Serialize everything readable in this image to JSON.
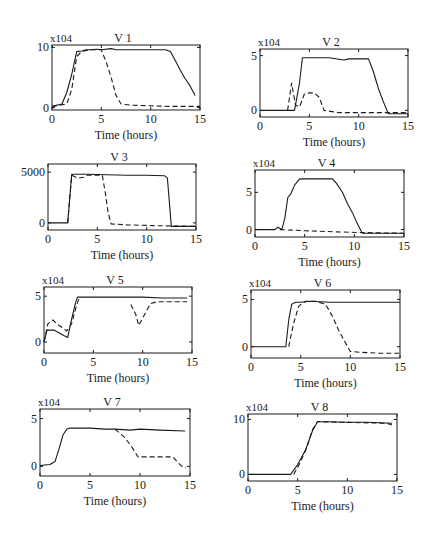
{
  "figure": {
    "xlabel": "Time (hours)",
    "x_ticks": [
      0,
      5,
      10,
      15
    ],
    "x_range": [
      0,
      15
    ],
    "line_color": "#1a1a1a",
    "series_styles": [
      "solid",
      "dashed"
    ]
  },
  "chart_data": [
    {
      "type": "line",
      "title": "V 1",
      "multiplier": "x104",
      "xlabel": "Time (hours)",
      "ylabel": "",
      "box": {
        "left": 52,
        "top": 45,
        "right": 200,
        "bottom": 110
      },
      "xlim": [
        0,
        15
      ],
      "ylim": [
        -0.4,
        10.4
      ],
      "y_ticks": [
        {
          "value": 0,
          "label": "0"
        },
        {
          "value": 10,
          "label": "10"
        }
      ],
      "series": [
        {
          "name": "solid",
          "style": "solid",
          "x": [
            0,
            1,
            1.5,
            2,
            2.5,
            3,
            3.5,
            4,
            4.5,
            5,
            6,
            6.5,
            7,
            8,
            9,
            10,
            11,
            11.5,
            12,
            12.5,
            13,
            13.5,
            14,
            14.5
          ],
          "y": [
            0.2,
            0.6,
            2.5,
            5.5,
            9.3,
            9.4,
            9.6,
            9.6,
            9.7,
            9.6,
            9.8,
            9.6,
            9.6,
            9.6,
            9.6,
            9.6,
            9.6,
            9.6,
            9.3,
            7.8,
            6.2,
            4.8,
            3.6,
            2.0
          ]
        },
        {
          "name": "dashed",
          "style": "dashed",
          "x": [
            0,
            1.5,
            2,
            2.5,
            3,
            3.5,
            4,
            4.5,
            5,
            5.5,
            6,
            6.5,
            7,
            8,
            10,
            12,
            14,
            15
          ],
          "y": [
            0.2,
            0.6,
            3.0,
            8.5,
            9.3,
            9.5,
            9.6,
            9.6,
            9.6,
            7.5,
            5.0,
            2.0,
            0.6,
            0.4,
            0.3,
            0.2,
            0.2,
            0.2
          ]
        }
      ]
    },
    {
      "type": "line",
      "title": "V 2",
      "multiplier": "x104",
      "xlabel": "Time (hours)",
      "ylabel": "",
      "box": {
        "left": 260,
        "top": 49,
        "right": 408,
        "bottom": 117
      },
      "xlim": [
        0,
        15
      ],
      "ylim": [
        -0.6,
        5.6
      ],
      "y_ticks": [
        {
          "value": 0,
          "label": "0"
        },
        {
          "value": 5,
          "label": "5"
        }
      ],
      "series": [
        {
          "name": "solid",
          "style": "solid",
          "x": [
            0,
            3.5,
            4,
            4.3,
            5,
            7,
            8.5,
            9,
            10,
            11,
            11.5,
            12,
            12.5,
            13,
            15
          ],
          "y": [
            0,
            0,
            2.5,
            4.8,
            4.8,
            4.8,
            4.6,
            4.7,
            4.7,
            4.7,
            3.5,
            2.0,
            0.8,
            -0.3,
            -0.3
          ]
        },
        {
          "name": "dashed",
          "style": "dashed",
          "x": [
            2.8,
            3.2,
            3.6,
            4.0,
            4.5,
            5.0,
            5.5,
            6.0,
            6.5,
            8,
            10,
            12,
            15
          ],
          "y": [
            0,
            2.5,
            0.5,
            0.3,
            1.5,
            1.6,
            1.6,
            1.2,
            0.0,
            -0.2,
            -0.2,
            -0.2,
            -0.2
          ]
        }
      ]
    },
    {
      "type": "line",
      "title": "V 3",
      "multiplier": "",
      "xlabel": "Time (hours)",
      "ylabel": "",
      "box": {
        "left": 48,
        "top": 164,
        "right": 196,
        "bottom": 230
      },
      "xlim": [
        0,
        15
      ],
      "ylim": [
        -700,
        5800
      ],
      "y_ticks": [
        {
          "value": 0,
          "label": "0"
        },
        {
          "value": 5000,
          "label": "5000"
        }
      ],
      "series": [
        {
          "name": "solid",
          "style": "solid",
          "x": [
            0,
            2.0,
            2.4,
            4,
            6,
            8,
            10,
            11.8,
            12.1,
            12.3,
            12.5,
            15
          ],
          "y": [
            0,
            0,
            4800,
            4800,
            4750,
            4700,
            4700,
            4650,
            4400,
            2000,
            -350,
            -350
          ]
        },
        {
          "name": "dashed",
          "style": "dashed",
          "x": [
            2.0,
            2.4,
            3.0,
            3.6,
            4.0,
            5.5,
            5.8,
            6.1,
            6.4,
            8,
            10,
            12,
            15
          ],
          "y": [
            0,
            4700,
            4400,
            4500,
            4700,
            4700,
            3000,
            1000,
            -100,
            -200,
            -250,
            -300,
            -350
          ]
        }
      ]
    },
    {
      "type": "line",
      "title": "V 4",
      "multiplier": "x104",
      "xlabel": "Time (hours)",
      "ylabel": "",
      "box": {
        "left": 255,
        "top": 170,
        "right": 404,
        "bottom": 237
      },
      "xlim": [
        0,
        15
      ],
      "ylim": [
        -1.0,
        8.0
      ],
      "y_ticks": [
        {
          "value": 0,
          "label": "0"
        },
        {
          "value": 5,
          "label": "5"
        }
      ],
      "series": [
        {
          "name": "solid",
          "style": "solid",
          "x": [
            0,
            2,
            2.3,
            2.7,
            3.0,
            3.3,
            3.6,
            4.0,
            4.5,
            5,
            6,
            7,
            7.8,
            8.2,
            8.8,
            9.3,
            9.8,
            10.3,
            10.8,
            12,
            15
          ],
          "y": [
            0,
            0,
            0.3,
            0.0,
            1.5,
            4.3,
            4.8,
            6.0,
            6.8,
            6.8,
            6.8,
            6.8,
            6.8,
            6.2,
            5.0,
            3.5,
            2.3,
            0.8,
            -0.5,
            -0.5,
            -0.5
          ]
        },
        {
          "name": "dashed",
          "style": "dashed",
          "x": [
            2.5,
            5,
            8,
            10.5,
            15
          ],
          "y": [
            0.0,
            -0.15,
            -0.3,
            -0.4,
            -0.5
          ]
        }
      ]
    },
    {
      "type": "line",
      "title": "V 5",
      "multiplier": "x104",
      "xlabel": "Time (hours)",
      "ylabel": "",
      "box": {
        "left": 44,
        "top": 287,
        "right": 192,
        "bottom": 353
      },
      "xlim": [
        0,
        15
      ],
      "ylim": [
        -1.2,
        6.0
      ],
      "y_ticks": [
        {
          "value": 0,
          "label": "0"
        },
        {
          "value": 5,
          "label": "5"
        }
      ],
      "series": [
        {
          "name": "solid",
          "style": "solid",
          "x": [
            0,
            0.3,
            0.6,
            1.0,
            1.5,
            2.0,
            2.4,
            2.8,
            3.2,
            3.4,
            5,
            8,
            10,
            12,
            14.5
          ],
          "y": [
            0,
            1.3,
            1.3,
            1.3,
            1.0,
            0.7,
            0.5,
            2.5,
            4.3,
            4.9,
            4.9,
            4.9,
            4.9,
            4.8,
            4.8
          ]
        },
        {
          "name": "dashed",
          "style": "dashed",
          "x": [
            0,
            0.4,
            0.9,
            1.3,
            1.8,
            2.3,
            2.8,
            3.3,
            3.6
          ],
          "y": [
            0,
            2.0,
            2.4,
            2.0,
            1.6,
            1.2,
            2.0,
            4.0,
            4.9
          ]
        },
        {
          "name": "dashed-late",
          "style": "dashed",
          "x": [
            8.8,
            9.3,
            9.6,
            10.2,
            10.8,
            11.5,
            13,
            14.5
          ],
          "y": [
            4.1,
            3.0,
            1.8,
            3.0,
            4.2,
            4.4,
            4.4,
            4.4
          ]
        }
      ]
    },
    {
      "type": "line",
      "title": "V 6",
      "multiplier": "x104",
      "xlabel": "Time (hours)",
      "ylabel": "",
      "box": {
        "left": 251,
        "top": 290,
        "right": 400,
        "bottom": 358
      },
      "xlim": [
        0,
        15
      ],
      "ylim": [
        -1.2,
        6.0
      ],
      "y_ticks": [
        {
          "value": 0,
          "label": "0"
        },
        {
          "value": 5,
          "label": "5"
        }
      ],
      "series": [
        {
          "name": "solid",
          "style": "solid",
          "x": [
            0,
            2,
            3.5,
            3.8,
            4.1,
            4.5,
            5,
            6,
            8,
            10,
            12,
            14,
            15
          ],
          "y": [
            0,
            0,
            0,
            2.8,
            4.5,
            4.7,
            4.7,
            4.8,
            4.7,
            4.7,
            4.7,
            4.7,
            4.7
          ]
        },
        {
          "name": "dashed",
          "style": "dashed",
          "x": [
            3.8,
            4.3,
            4.8,
            5.5,
            6.5,
            7.5,
            8.2,
            8.8,
            9.4,
            10.0,
            11,
            13,
            15
          ],
          "y": [
            0,
            2.5,
            4.3,
            4.8,
            4.8,
            4.5,
            3.2,
            1.8,
            0.6,
            -0.5,
            -0.6,
            -0.7,
            -0.7
          ]
        }
      ]
    },
    {
      "type": "line",
      "title": "V 7",
      "multiplier": "x104",
      "xlabel": "Time (hours)",
      "ylabel": "",
      "box": {
        "left": 40,
        "top": 409,
        "right": 190,
        "bottom": 476
      },
      "xlim": [
        0,
        15
      ],
      "ylim": [
        -1.0,
        6.0
      ],
      "y_ticks": [
        {
          "value": 0,
          "label": "0"
        },
        {
          "value": 5,
          "label": "5"
        }
      ],
      "series": [
        {
          "name": "solid",
          "style": "solid",
          "x": [
            0,
            1.0,
            1.5,
            1.9,
            2.3,
            2.7,
            3.0,
            5,
            6.5,
            7.5,
            9,
            10,
            12,
            14.5
          ],
          "y": [
            0.1,
            0.2,
            0.5,
            1.8,
            3.3,
            3.9,
            4.0,
            4.0,
            3.9,
            3.9,
            3.8,
            3.9,
            3.8,
            3.7
          ]
        },
        {
          "name": "dashed",
          "style": "dashed",
          "x": [
            7.5,
            8.5,
            9.2,
            9.8,
            10.5,
            12,
            13.3,
            13.7,
            14.2,
            14.6
          ],
          "y": [
            3.9,
            3.0,
            2.0,
            1.0,
            1.0,
            1.0,
            1.0,
            0.5,
            0.0,
            -0.1
          ]
        }
      ]
    },
    {
      "type": "line",
      "title": "V 8",
      "multiplier": "x104",
      "xlabel": "Time (hours)",
      "ylabel": "",
      "box": {
        "left": 248,
        "top": 414,
        "right": 397,
        "bottom": 481
      },
      "xlim": [
        0,
        15
      ],
      "ylim": [
        -1.2,
        11.0
      ],
      "y_ticks": [
        {
          "value": 0,
          "label": "0"
        },
        {
          "value": 10,
          "label": "10"
        }
      ],
      "series": [
        {
          "name": "solid",
          "style": "solid",
          "x": [
            0,
            4.3,
            5.0,
            5.8,
            6.5,
            7.0,
            8,
            10,
            12,
            14.5
          ],
          "y": [
            0,
            0,
            1.8,
            4.5,
            8.0,
            9.6,
            9.6,
            9.5,
            9.5,
            9.3
          ]
        },
        {
          "name": "dashed",
          "style": "dashed",
          "x": [
            4.6,
            5.2,
            5.9,
            6.5,
            7.0,
            14.0,
            14.5
          ],
          "y": [
            0,
            2.0,
            4.8,
            8.2,
            9.6,
            9.3,
            9.0
          ]
        }
      ]
    }
  ]
}
